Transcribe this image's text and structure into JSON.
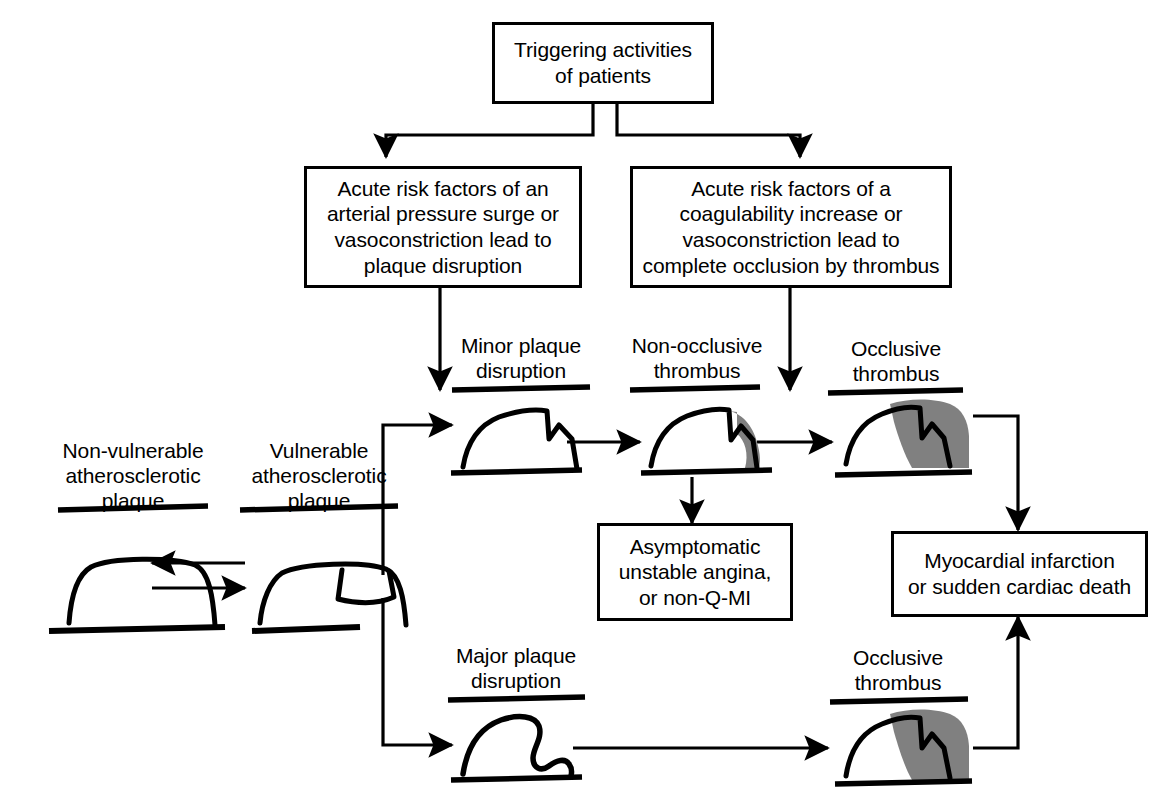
{
  "figure": {
    "type": "flowchart",
    "colors": {
      "line": "#000000",
      "thrombus_fill": "#808080",
      "background": "#ffffff"
    }
  },
  "boxes": {
    "trigger": "Triggering activities\nof patients",
    "risk_left": "Acute risk factors of an\narterial pressure surge or\nvasoconstriction lead to\nplaque disruption",
    "risk_right": "Acute risk factors of a\ncoagulability increase or\nvasoconstriction lead to\ncomplete occlusion by thrombus",
    "asymptomatic": "Asymptomatic\nunstable angina,\nor non-Q-MI",
    "myocardial": "Myocardial infarction\nor sudden cardiac death"
  },
  "captions": {
    "non_vulnerable_plaque": "Non-vulnerable\natherosclerotic\nplaque",
    "vulnerable_plaque": "Vulnerable\natherosclerotic\nplaque",
    "minor_plaque_disruption": "Minor plaque\ndisruption",
    "non_occlusive_thrombus": "Non-occlusive\nthrombus",
    "occlusive_thrombus_top": "Occlusive\nthrombus",
    "major_plaque_disruption": "Major plaque\ndisruption",
    "occlusive_thrombus_bottom": "Occlusive\nthrombus"
  },
  "flow_sequence": {
    "upper_pathway": [
      "Vulnerable atherosclerotic plaque",
      "Minor plaque disruption",
      "Non-occlusive thrombus",
      "Occlusive thrombus",
      "Myocardial infarction or sudden cardiac death"
    ],
    "branch_pathway": [
      "Non-occlusive thrombus",
      "Asymptomatic unstable angina, or non-Q-MI"
    ],
    "lower_pathway": [
      "Vulnerable atherosclerotic plaque",
      "Major plaque disruption",
      "Occlusive thrombus",
      "Myocardial infarction or sudden cardiac death"
    ],
    "reversible_pair": [
      "Non-vulnerable atherosclerotic plaque",
      "Vulnerable atherosclerotic plaque"
    ]
  }
}
